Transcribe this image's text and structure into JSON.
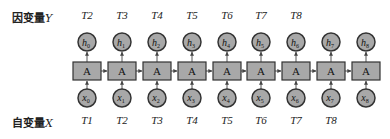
{
  "labels": {
    "dependent_prefix": "因变量",
    "dependent_var": "Y",
    "independent_prefix": "自变量",
    "independent_var": "X"
  },
  "colors": {
    "node_fill": "#a8a8a8",
    "node_stroke": "#333333",
    "edge": "#555555",
    "text": "#222222"
  },
  "columns_x": [
    87,
    122,
    157,
    192,
    227,
    261,
    296,
    331,
    366
  ],
  "top_time_labels": [
    "T2",
    "T3",
    "T4",
    "T5",
    "T6",
    "T7",
    "T8"
  ],
  "bottom_time_labels": [
    "T1",
    "T2",
    "T3",
    "T4",
    "T5",
    "T6",
    "T7",
    "T8"
  ],
  "cell_label": "A",
  "outputs": [
    {
      "base": "h",
      "sub": "0"
    },
    {
      "base": "h",
      "sub": "1"
    },
    {
      "base": "h",
      "sub": "2"
    },
    {
      "base": "h",
      "sub": "3"
    },
    {
      "base": "h",
      "sub": "4"
    },
    {
      "base": "h",
      "sub": "5"
    },
    {
      "base": "h",
      "sub": "6"
    },
    {
      "base": "h",
      "sub": "7"
    },
    {
      "base": "h",
      "sub": "8"
    }
  ],
  "inputs": [
    {
      "base": "x",
      "sub": "0"
    },
    {
      "base": "x",
      "sub": "1"
    },
    {
      "base": "x",
      "sub": "2"
    },
    {
      "base": "x",
      "sub": "3"
    },
    {
      "base": "x",
      "sub": "4"
    },
    {
      "base": "x",
      "sub": "5"
    },
    {
      "base": "x",
      "sub": "6"
    },
    {
      "base": "x",
      "sub": "7"
    },
    {
      "base": "x",
      "sub": "8"
    }
  ]
}
